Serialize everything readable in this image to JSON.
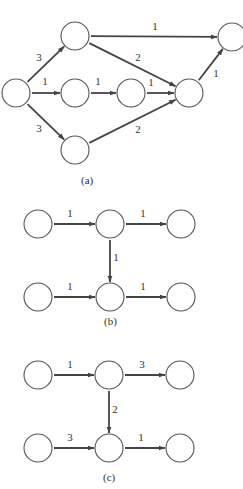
{
  "diagrams": [
    {
      "id": "a",
      "caption": "(a)",
      "caption_pos": [
        81,
        184
      ],
      "radius": 14,
      "nodes": [
        {
          "id": "s",
          "x": 16,
          "y": 93
        },
        {
          "id": "t",
          "x": 75,
          "y": 36
        },
        {
          "id": "m1",
          "x": 75,
          "y": 93
        },
        {
          "id": "m2",
          "x": 131,
          "y": 93
        },
        {
          "id": "b",
          "x": 75,
          "y": 150
        },
        {
          "id": "j",
          "x": 189,
          "y": 93
        },
        {
          "id": "e",
          "x": 232,
          "y": 37
        }
      ],
      "edges": [
        {
          "from": "s",
          "to": "t",
          "weight": "3",
          "lx": 39,
          "ly": 61
        },
        {
          "from": "s",
          "to": "m1",
          "weight": "1",
          "lx": 45,
          "ly": 85
        },
        {
          "from": "s",
          "to": "b",
          "weight": "3",
          "lx": 39,
          "ly": 132
        },
        {
          "from": "t",
          "to": "e",
          "weight": "1",
          "lx": 155,
          "ly": 30
        },
        {
          "from": "t",
          "to": "j",
          "weight": "2",
          "lx": 138,
          "ly": 61
        },
        {
          "from": "m1",
          "to": "m2",
          "weight": "1",
          "lx": 98,
          "ly": 85
        },
        {
          "from": "m2",
          "to": "j",
          "weight": "1",
          "lx": 151,
          "ly": 86
        },
        {
          "from": "b",
          "to": "j",
          "weight": "2",
          "lx": 138,
          "ly": 133
        },
        {
          "from": "j",
          "to": "e",
          "weight": "1",
          "lx": 216,
          "ly": 77
        }
      ]
    },
    {
      "id": "b",
      "caption": "(b)",
      "caption_pos": [
        104,
        325
      ],
      "radius": 14,
      "nodes": [
        {
          "id": "a1",
          "x": 38,
          "y": 224
        },
        {
          "id": "a2",
          "x": 110,
          "y": 224
        },
        {
          "id": "a3",
          "x": 181,
          "y": 224
        },
        {
          "id": "b1",
          "x": 38,
          "y": 297
        },
        {
          "id": "b2",
          "x": 110,
          "y": 297
        },
        {
          "id": "b3",
          "x": 181,
          "y": 297
        }
      ],
      "edges": [
        {
          "from": "a1",
          "to": "a2",
          "weight": "1",
          "lx": 70,
          "ly": 217
        },
        {
          "from": "a2",
          "to": "a3",
          "weight": "1",
          "lx": 143,
          "ly": 217
        },
        {
          "from": "a2",
          "to": "b2",
          "weight": "1",
          "lx": 116,
          "ly": 261
        },
        {
          "from": "b1",
          "to": "b2",
          "weight": "1",
          "lx": 70,
          "ly": 290
        },
        {
          "from": "b2",
          "to": "b3",
          "weight": "1",
          "lx": 143,
          "ly": 290
        }
      ]
    },
    {
      "id": "c",
      "caption": "(c)",
      "caption_pos": [
        103,
        481
      ],
      "radius": 14,
      "nodes": [
        {
          "id": "a1",
          "x": 38,
          "y": 375
        },
        {
          "id": "a2",
          "x": 109,
          "y": 375
        },
        {
          "id": "a3",
          "x": 180,
          "y": 375
        },
        {
          "id": "b1",
          "x": 38,
          "y": 448
        },
        {
          "id": "b2",
          "x": 109,
          "y": 448
        },
        {
          "id": "b3",
          "x": 180,
          "y": 448
        }
      ],
      "edges": [
        {
          "from": "a1",
          "to": "a2",
          "weight": "1",
          "lx": 70,
          "ly": 368
        },
        {
          "from": "a2",
          "to": "a3",
          "weight": "3",
          "lx": 142,
          "ly": 368
        },
        {
          "from": "a2",
          "to": "b2",
          "weight": "2",
          "lx": 115,
          "ly": 413
        },
        {
          "from": "b1",
          "to": "b2",
          "weight": "3",
          "lx": 70,
          "ly": 441
        },
        {
          "from": "b2",
          "to": "b3",
          "weight": "1",
          "lx": 141,
          "ly": 441
        }
      ]
    }
  ]
}
